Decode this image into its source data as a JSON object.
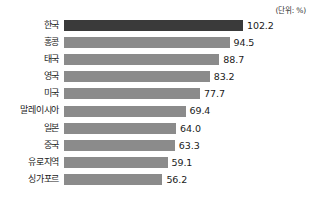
{
  "unit_note": "(단위: %)",
  "chart_data": {
    "type": "bar",
    "orientation": "horizontal",
    "title": "",
    "subtitle": "",
    "xlabel": "",
    "ylabel": "",
    "unit": "(단위: %)",
    "grid": false,
    "legend": false,
    "xlim": [
      0,
      102.2
    ],
    "categories": [
      "한국",
      "홍콩",
      "태국",
      "영국",
      "미국",
      "말레이시아",
      "일본",
      "중국",
      "유로지역",
      "싱가포르"
    ],
    "values": [
      102.2,
      94.5,
      88.7,
      83.2,
      77.7,
      69.4,
      64.0,
      63.3,
      59.1,
      56.2
    ],
    "value_labels": [
      "102.2",
      "94.5",
      "88.7",
      "83.2",
      "77.7",
      "69.4",
      "64.0",
      "63.3",
      "59.1",
      "56.2"
    ],
    "highlight_index": 0,
    "colors": {
      "bar": "#8b8b8b",
      "bar_highlight": "#3a3a3a",
      "text": "#1a1a1a",
      "background": "#ffffff"
    }
  }
}
